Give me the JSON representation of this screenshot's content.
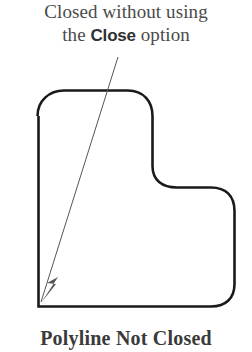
{
  "figure": {
    "width": 252,
    "height": 352,
    "background_color": "#ffffff",
    "stroke_color": "#1a1a1a",
    "annotation_color": "#555555",
    "text_color": "#3a3a3a"
  },
  "caption_top": {
    "line1": "Closed without using",
    "line2_prefix": "the ",
    "line2_emphasis": "Close",
    "line2_suffix": " option",
    "full_text": "Closed without using the Close option"
  },
  "caption_bottom": {
    "text": "Polyline Not Closed"
  },
  "annotation": {
    "type": "leader-arrow",
    "label": "points to the open gap at the lower-left corner",
    "start_x": 118,
    "start_y": 57,
    "end_x": 41,
    "end_y": 302,
    "stroke_width": 1
  },
  "shape": {
    "name": "polyline-not-closed",
    "description": "L-shaped polyline with rounded corners, open at the lower-left corner",
    "stroke_width": 2.6,
    "corner_radius": 22,
    "path": "M 37.5 116 C 37.5 101 49 90.5 64 90.5 L 128 90.5 C 143 90.5 152.5 101 152.5 116 L 152.5 166 C 152.5 180 162 187.5 177 187.5 L 211 187.5 C 226 187.5 234.5 196 234.5 211 L 234.5 284 C 234.5 298 226 306.5 211 306.5 L 38.5 306.5 L 38.5 116",
    "open_gap": {
      "x": 38,
      "y": 304,
      "note": "endpoints do not meet at the lower-left corner"
    }
  },
  "arrowhead": {
    "points": "41,303 56,284 47,283 58,277",
    "fill": "#555555"
  }
}
